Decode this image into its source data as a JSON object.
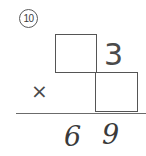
{
  "problem": {
    "number_label": "10",
    "number_style": "circled",
    "type": "multiplication-missing-digits",
    "operator_symbol": "×",
    "multiplicand": {
      "tens_box": "",
      "ones_box": "",
      "description": "two empty answer boxes for the multiplicand digits"
    },
    "multiplier": {
      "digit": "3"
    },
    "product": {
      "tens_digit": "6",
      "ones_digit": "9",
      "full": "69"
    }
  },
  "colors": {
    "background": "#ffffff",
    "box_stroke": "#555555",
    "print_ink": "#4a4a4a",
    "hand_ink": "#3a3a3a",
    "rule_line": "#6b6b6b",
    "circle_stroke": "#5a5a5a"
  }
}
